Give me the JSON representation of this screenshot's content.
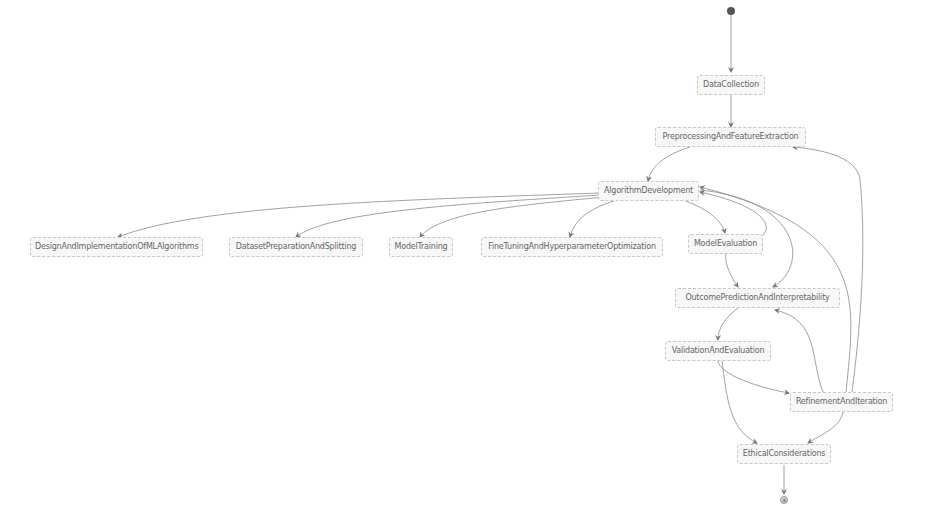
{
  "diagram": {
    "type": "state-diagram",
    "colors": {
      "background": "#ffffff",
      "node_fill": "#f7f7f7",
      "node_border": "#c8c8c8",
      "node_text": "#666666",
      "edge": "#888888",
      "start": "#555555"
    },
    "nodes": {
      "data_collection": "DataCollection",
      "preprocessing": "PreprocessingAndFeatureExtraction",
      "algorithm_development": "AlgorithmDevelopment",
      "design_implementation": "DesignAndImplementationOfMLAlgorithms",
      "dataset_preparation": "DatasetPreparationAndSplitting",
      "model_training": "ModelTraining",
      "fine_tuning": "FineTuningAndHyperparameterOptimization",
      "model_evaluation": "ModelEvaluation",
      "outcome_prediction": "OutcomePredictionAndInterpretability",
      "validation": "ValidationAndEvaluation",
      "refinement": "RefinementAndIteration",
      "ethical": "EthicalConsiderations"
    },
    "edges": [
      {
        "from": "start",
        "to": "DataCollection"
      },
      {
        "from": "DataCollection",
        "to": "PreprocessingAndFeatureExtraction"
      },
      {
        "from": "PreprocessingAndFeatureExtraction",
        "to": "AlgorithmDevelopment"
      },
      {
        "from": "AlgorithmDevelopment",
        "to": "DesignAndImplementationOfMLAlgorithms"
      },
      {
        "from": "AlgorithmDevelopment",
        "to": "DatasetPreparationAndSplitting"
      },
      {
        "from": "AlgorithmDevelopment",
        "to": "ModelTraining"
      },
      {
        "from": "AlgorithmDevelopment",
        "to": "FineTuningAndHyperparameterOptimization"
      },
      {
        "from": "AlgorithmDevelopment",
        "to": "ModelEvaluation"
      },
      {
        "from": "ModelEvaluation",
        "to": "AlgorithmDevelopment"
      },
      {
        "from": "ModelEvaluation",
        "to": "OutcomePredictionAndInterpretability"
      },
      {
        "from": "AlgorithmDevelopment",
        "to": "OutcomePredictionAndInterpretability"
      },
      {
        "from": "OutcomePredictionAndInterpretability",
        "to": "ValidationAndEvaluation"
      },
      {
        "from": "ValidationAndEvaluation",
        "to": "RefinementAndIteration"
      },
      {
        "from": "ValidationAndEvaluation",
        "to": "EthicalConsiderations"
      },
      {
        "from": "RefinementAndIteration",
        "to": "OutcomePredictionAndInterpretability"
      },
      {
        "from": "RefinementAndIteration",
        "to": "AlgorithmDevelopment"
      },
      {
        "from": "RefinementAndIteration",
        "to": "PreprocessingAndFeatureExtraction"
      },
      {
        "from": "RefinementAndIteration",
        "to": "EthicalConsiderations"
      },
      {
        "from": "EthicalConsiderations",
        "to": "end"
      }
    ]
  }
}
